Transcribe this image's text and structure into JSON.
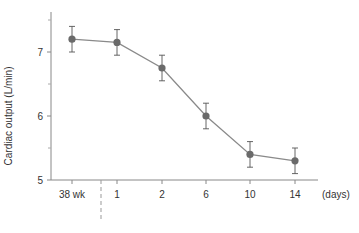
{
  "chart_data": {
    "type": "line",
    "title": "",
    "xlabel": "(days)",
    "ylabel": "Cardiac output (L/min)",
    "categories": [
      "38 wk",
      "1",
      "2",
      "6",
      "10",
      "14"
    ],
    "series": [
      {
        "name": "Cardiac output",
        "values": [
          7.2,
          7.15,
          6.75,
          6.0,
          5.4,
          5.3
        ],
        "error": [
          0.2,
          0.2,
          0.2,
          0.2,
          0.2,
          0.2
        ]
      }
    ],
    "ylim": [
      5,
      7.6
    ],
    "yticks": [
      5,
      6,
      7
    ],
    "yminor_ticks": [
      5.5,
      6.5,
      7.5
    ],
    "annotations": [
      "dashed vertical line between 38 wk and 1 marking delivery"
    ],
    "grid": false,
    "legend": "none",
    "colors": {
      "line": "#8a8a8a",
      "marker": "#6a6a6a",
      "axis": "#888888",
      "error_bar": "#555555",
      "dashed": "#999999"
    }
  },
  "axis": {
    "y_label": "Cardiac output (L/min)",
    "x_unit": "(days)",
    "y_tick_labels": [
      "5",
      "6",
      "7"
    ],
    "x_tick_labels": [
      "38 wk",
      "1",
      "2",
      "6",
      "10",
      "14"
    ]
  }
}
